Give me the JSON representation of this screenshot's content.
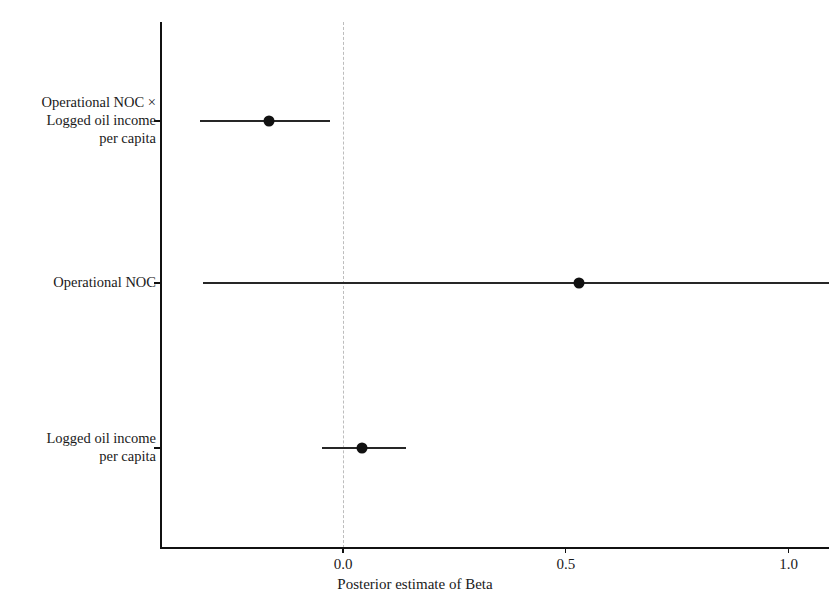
{
  "chart_data": {
    "type": "scatter",
    "subtype": "coefficient-plot",
    "title": "",
    "xlabel": "Posterior estimate of Beta",
    "ylabel": "",
    "xlim": [
      -0.41,
      1.09
    ],
    "xticks": [
      0.0,
      0.5,
      1.0
    ],
    "xtick_labels": [
      "0.0",
      "0.5",
      "1.0"
    ],
    "grid": false,
    "legend": null,
    "reference_line": {
      "x": 0.0,
      "style": "dashed",
      "color": "#bdbdbd"
    },
    "categories": [
      "Operational NOC ×\nLogged oil income\nper capita",
      "Operational NOC",
      "Logged oil income\nper capita"
    ],
    "points": [
      {
        "label": "Operational NOC ×\nLogged oil income\nper capita",
        "estimate": -0.165,
        "ci_low": -0.32,
        "ci_high": -0.03,
        "clipped_right": false
      },
      {
        "label": "Operational NOC",
        "estimate": 0.53,
        "ci_low": -0.315,
        "ci_high": 1.09,
        "clipped_right": true
      },
      {
        "label": "Logged oil income\nper capita",
        "estimate": 0.043,
        "ci_low": -0.047,
        "ci_high": 0.142,
        "clipped_right": false
      }
    ],
    "colors": {
      "point": "#111111",
      "interval": "#262626",
      "axis": "#111111",
      "reference": "#bdbdbd"
    }
  },
  "axis": {
    "x_title": "Posterior estimate of Beta",
    "tick_0": "0.0",
    "tick_1": "0.5",
    "tick_2": "1.0"
  },
  "labels": {
    "row_0": "Operational NOC ×\nLogged oil income\nper capita",
    "row_1": "Operational NOC",
    "row_2": "Logged oil income\nper capita"
  },
  "title_remnant": ""
}
